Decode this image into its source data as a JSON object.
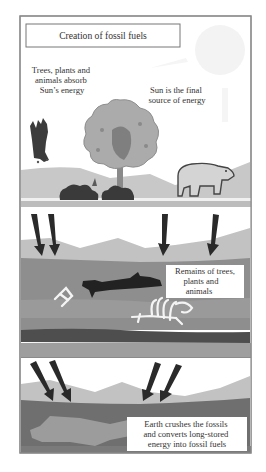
{
  "title": "Creation of fossil fuels",
  "panels": [
    {
      "id": "surface",
      "labels": [
        {
          "lines": [
            "Trees, plants and",
            "animals absorb",
            "Sun’s energy"
          ]
        },
        {
          "lines": [
            "Sun is the final",
            "source of energy"
          ]
        }
      ],
      "icons": [
        "sun-icon",
        "shrub-icon",
        "tree-icon",
        "bush-icon",
        "bear-icon"
      ]
    },
    {
      "id": "burial",
      "labels": [
        {
          "lines": [
            "Remains of trees,",
            "plants and",
            "animals"
          ]
        }
      ],
      "icons": [
        "pressure-arrow-icon",
        "fallen-log-icon",
        "bones-icon",
        "skeleton-icon"
      ]
    },
    {
      "id": "compression",
      "labels": [
        {
          "lines": [
            "Earth crushes the fossils",
            "and converts long-stored",
            "energy into fossil fuels"
          ]
        }
      ],
      "icons": [
        "pressure-arrow-icon"
      ]
    }
  ],
  "colors": {
    "frame": "#8a8a8a",
    "text": "#333333",
    "hill_light": "#c4c4c4",
    "tree_canopy": "#a9a9a9",
    "tree_dark": "#7d7d7d",
    "strata_mid": "#8f8f8f",
    "strata_dark": "#5e5e5e",
    "strata_darkest": "#484848",
    "arrow": "#2a2a2a",
    "sun": "#f2f2f2"
  }
}
